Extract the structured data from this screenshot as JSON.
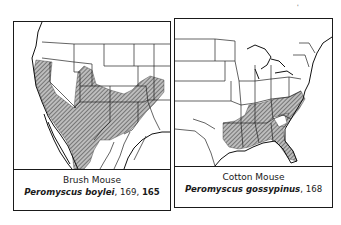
{
  "figure": {
    "corner_mark": "'",
    "panels": [
      {
        "id": "left",
        "common_name": "Brush Mouse",
        "scientific_name": "Peromyscus boylei",
        "page_refs_plain": ", 169, ",
        "page_ref_bold": "165",
        "map_region": "Western United States and northern Mexico",
        "range_description": "Hatched range across California, Southwest, Texas and into Mexico",
        "hatch_color": "#555555"
      },
      {
        "id": "right",
        "common_name": "Cotton Mouse",
        "scientific_name": "Peromyscus gossypinus",
        "page_refs_plain": ", 168",
        "page_ref_bold": "",
        "map_region": "Eastern United States",
        "range_description": "Hatched range across the Southeast from east Texas to the Carolinas and Florida",
        "hatch_color": "#555555"
      }
    ]
  }
}
